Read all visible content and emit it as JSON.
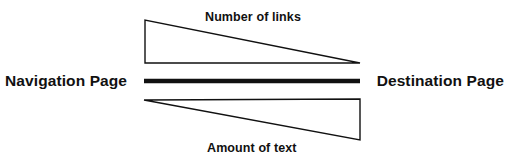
{
  "diagram": {
    "left_label": "Navigation Page",
    "right_label": "Destination Page",
    "top_label": "Number of links",
    "bottom_label": "Amount of text",
    "colors": {
      "stroke": "#111111",
      "fill": "#ffffff",
      "background": "#ffffff",
      "text": "#111111"
    },
    "geometry": {
      "top_triangle_points": "145,20 145,63 360,63",
      "center_bar": {
        "x1": 144,
        "y1": 81,
        "x2": 360,
        "y2": 81,
        "thickness": 4
      },
      "bottom_triangle_points": "144,100 360,99 360,140"
    }
  },
  "chart_data": {
    "type": "diagram",
    "axis_left": "Navigation Page",
    "axis_right": "Destination Page",
    "series": [
      {
        "name": "Number of links",
        "shape": "triangle",
        "direction": "decreasing",
        "value_at_left": "high",
        "value_at_right": "low"
      },
      {
        "name": "Amount of text",
        "shape": "triangle",
        "direction": "increasing",
        "value_at_left": "low",
        "value_at_right": "high"
      }
    ],
    "annotations": [
      "Number of links",
      "Amount of text",
      "Navigation Page",
      "Destination Page"
    ]
  }
}
